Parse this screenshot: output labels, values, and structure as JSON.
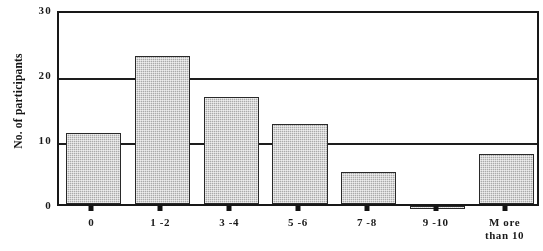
{
  "chart_data": {
    "type": "bar",
    "title": "",
    "subtitle": "",
    "xlabel": "",
    "ylabel": "No. of participants",
    "categories": [
      "0",
      "1 - 2",
      "3 - 4",
      "5 - 6",
      "7 - 8",
      "9 - 10",
      "More than 10"
    ],
    "category_labels_raw": [
      {
        "line1": "0",
        "line2": ""
      },
      {
        "line1": "1 -2",
        "line2": ""
      },
      {
        "line1": "3 -4",
        "line2": ""
      },
      {
        "line1": "5 -6",
        "line2": ""
      },
      {
        "line1": "7 -8",
        "line2": ""
      },
      {
        "line1": "9 -10",
        "line2": ""
      },
      {
        "line1": "M ore",
        "line2": "than 10"
      }
    ],
    "values": [
      11,
      22.7,
      16.4,
      12.3,
      5,
      0.4,
      7.7
    ],
    "ylim": [
      0,
      30
    ],
    "yticks": [
      0,
      10,
      20,
      30
    ],
    "ytick_labels": [
      "0",
      "10",
      "20",
      "30"
    ],
    "grid": true,
    "grid_axis": "y",
    "legend": false,
    "legend_position": "none",
    "bar_fill_color": "#a9a9a9",
    "bar_edge_color": "#2b2b2b",
    "axis_color": "#1a1a1a",
    "background_color": "#ffffff"
  }
}
